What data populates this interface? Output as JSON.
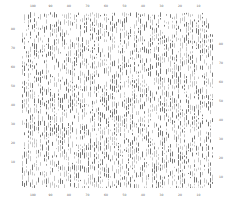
{
  "chart_data": {
    "type": "scatter",
    "title": "",
    "xlabel": "",
    "ylabel": "",
    "top_ticks": [
      "100",
      "90",
      "80",
      "70",
      "60",
      "50",
      "40",
      "30",
      "20",
      "10"
    ],
    "bottom_ticks": [
      "100",
      "90",
      "80",
      "70",
      "60",
      "50",
      "40",
      "30",
      "20",
      "10"
    ],
    "left_ticks": [
      "80",
      "70",
      "60",
      "50",
      "40",
      "30",
      "20",
      "10"
    ],
    "right_ticks": [
      "80",
      "70",
      "60",
      "50",
      "40",
      "30",
      "20",
      "10"
    ],
    "xlim": [
      100,
      0
    ],
    "ylim": [
      0,
      85
    ],
    "grid": false,
    "legend": null,
    "marker": "vertical dash",
    "density": "very high, near-uniform texture of short vertical tick marks",
    "colors": {
      "dark": "#555555",
      "light": "#bbbbbb",
      "background": "#ffffff"
    }
  }
}
